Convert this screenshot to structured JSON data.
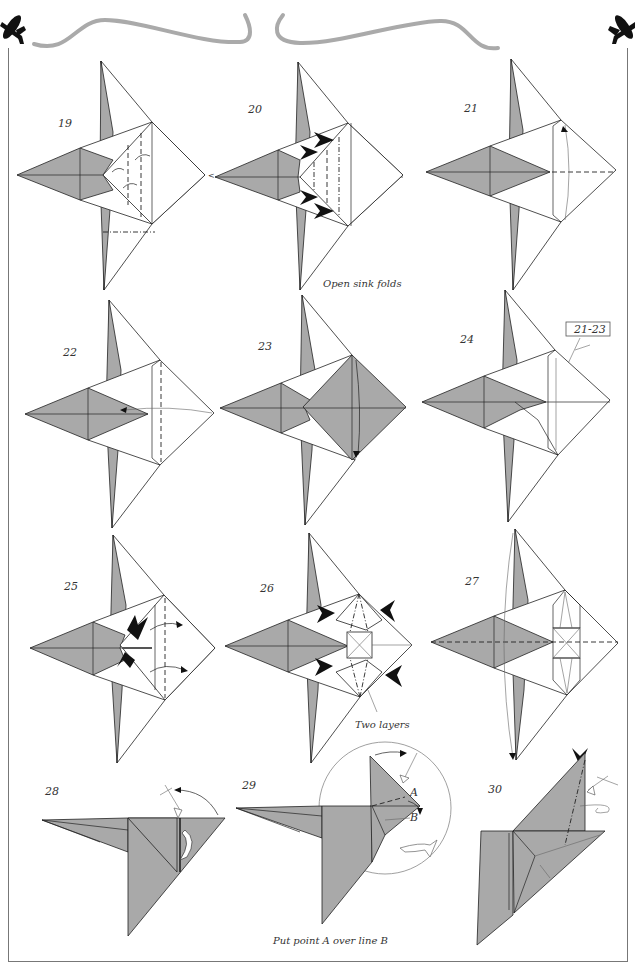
{
  "page": {
    "type": "origami instruction diagram",
    "colors": {
      "paper_colored": "#a9a9a9",
      "paper_white": "#ffffff",
      "line": "#222222",
      "decoration": "#aaaaaa",
      "frame": "#777777"
    }
  },
  "header": {
    "left_icon": "airplane-silhouette-icon",
    "right_icon": "airplane-silhouette-icon",
    "ornament": "curved-swirl-divider"
  },
  "steps": [
    {
      "number": "19",
      "caption": ""
    },
    {
      "number": "20",
      "caption": "Open sink folds"
    },
    {
      "number": "21",
      "caption": ""
    },
    {
      "number": "22",
      "caption": ""
    },
    {
      "number": "23",
      "caption": ""
    },
    {
      "number": "24",
      "caption": "",
      "reference_box": "21-23"
    },
    {
      "number": "25",
      "caption": ""
    },
    {
      "number": "26",
      "caption": "Two layers"
    },
    {
      "number": "27",
      "caption": ""
    },
    {
      "number": "28",
      "caption": ""
    },
    {
      "number": "29",
      "caption": "",
      "labels": [
        "A",
        "B"
      ]
    },
    {
      "number": "30",
      "caption": ""
    }
  ],
  "footer": {
    "instruction": "Put point A over line B"
  }
}
